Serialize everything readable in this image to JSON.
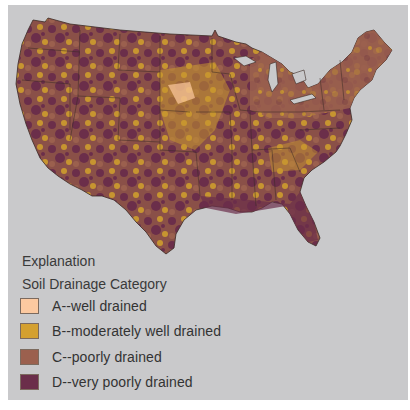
{
  "map": {
    "subject": "Conterminous United States soil drainage map",
    "background_color": "#c9c9cb",
    "state_border_color": "#3b2a25"
  },
  "legend": {
    "heading": "Explanation",
    "subheading": "Soil Drainage Category",
    "items": [
      {
        "code": "A",
        "label": "A--well drained",
        "color": "#fcc9a0"
      },
      {
        "code": "B",
        "label": "B--moderately well drained",
        "color": "#d4a030"
      },
      {
        "code": "C",
        "label": "C--poorly drained",
        "color": "#9b604e"
      },
      {
        "code": "D",
        "label": "D--very poorly drained",
        "color": "#6b2e4a"
      }
    ]
  }
}
